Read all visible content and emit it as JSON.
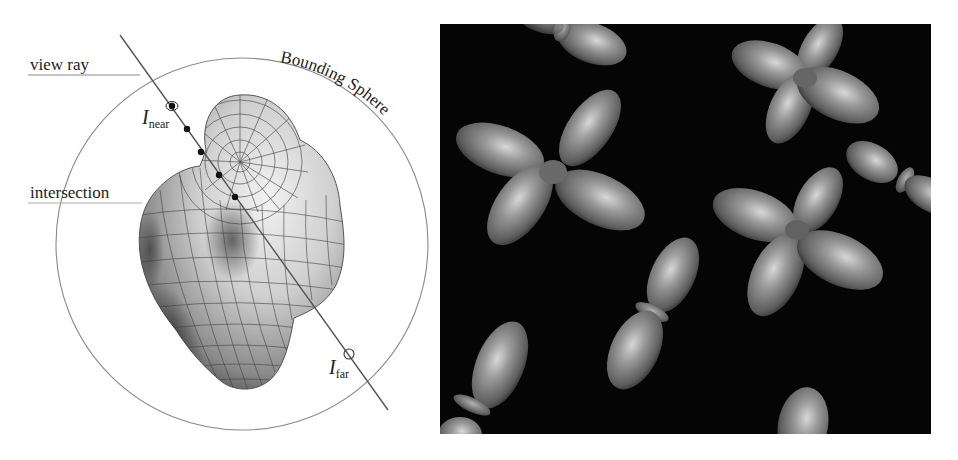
{
  "figure": {
    "left_panel": {
      "labels": {
        "view_ray": "view ray",
        "intersection": "intersection",
        "bounding_sphere": "Bounding Sphere",
        "i_near_main": "I",
        "i_near_sub": "near",
        "i_far_main": "I",
        "i_far_sub": "far"
      },
      "colors": {
        "line": "#555555",
        "sphere": "#777777",
        "surface_light": "#e8e8e8",
        "surface_dark": "#4a4a4a",
        "mesh": "#3c3c3c",
        "dot": "#111111"
      },
      "ray": {
        "start": [
          120,
          35
        ],
        "end": [
          388,
          410
        ]
      },
      "sphere": {
        "cx": 242,
        "cy": 244,
        "r": 186
      },
      "sample_points": [
        [
          187,
          129
        ],
        [
          201,
          152
        ],
        [
          219,
          175
        ],
        [
          235,
          197
        ]
      ],
      "i_near_point": [
        172,
        106
      ],
      "i_far_point": [
        349,
        354
      ]
    },
    "right_panel": {
      "background": "#050505",
      "object_color": "#8a8a8a",
      "objects": [
        {
          "type": "cross",
          "cx": 553,
          "cy": 172
        },
        {
          "type": "cross",
          "cx": 805,
          "cy": 78
        },
        {
          "type": "cross",
          "cx": 797,
          "cy": 230
        },
        {
          "type": "dumbbell",
          "cx": 650,
          "cy": 310
        },
        {
          "type": "dumbbell",
          "cx": 475,
          "cy": 405
        },
        {
          "type": "dumbbell",
          "cx": 905,
          "cy": 178
        },
        {
          "type": "dumbbell",
          "cx": 600,
          "cy": 30
        },
        {
          "type": "lobe",
          "cx": 800,
          "cy": 420
        }
      ]
    }
  }
}
